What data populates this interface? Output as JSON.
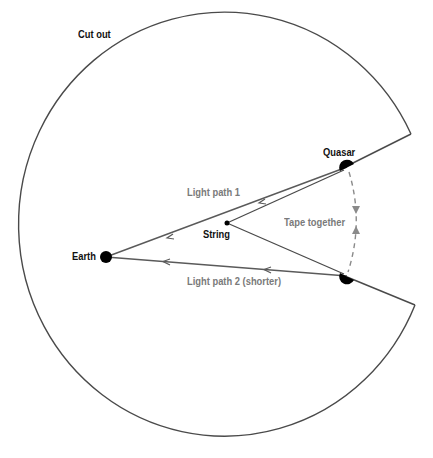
{
  "diagram": {
    "title": "",
    "colors": {
      "outline": "#4a4a4a",
      "path": "#5a5a5a",
      "dot": "#000000",
      "dashed": "#8a8a8a",
      "label_dark": "#111111",
      "label_gray": "#7a7a7a"
    },
    "labels": {
      "cut_out": "Cut out",
      "quasar": "Quasar",
      "light_path_1": "Light path 1",
      "string": "String",
      "tape_together": "Tape together",
      "earth": "Earth",
      "light_path_2": "Light path 2 (shorter)"
    },
    "nodes": [
      {
        "id": "earth",
        "label": "Earth",
        "x": 106,
        "y": 257
      },
      {
        "id": "string",
        "label": "String",
        "x": 227,
        "y": 223
      },
      {
        "id": "quasar",
        "label": "Quasar",
        "x": 347,
        "y": 168
      },
      {
        "id": "quasar-image",
        "label": "",
        "x": 347,
        "y": 276
      }
    ],
    "edges": [
      {
        "from": "quasar",
        "to": "earth",
        "label": "Light path 1",
        "arrows": "toward earth"
      },
      {
        "from": "quasar-image",
        "to": "earth",
        "label": "Light path 2 (shorter)",
        "arrows": "toward earth"
      },
      {
        "from": "string",
        "to": "quasar",
        "label": ""
      },
      {
        "from": "string",
        "to": "quasar-image",
        "label": ""
      },
      {
        "from": "quasar",
        "to": "quasar-image",
        "label": "Tape together",
        "style": "dashed",
        "arrows": "both meeting"
      }
    ],
    "cutout": {
      "shape": "circle with wedge removed",
      "center": [
        222,
        226
      ],
      "radius": 206,
      "notch_upper": [
        411,
        134
      ],
      "notch_lower": [
        415,
        305
      ],
      "apex": "earth"
    }
  }
}
